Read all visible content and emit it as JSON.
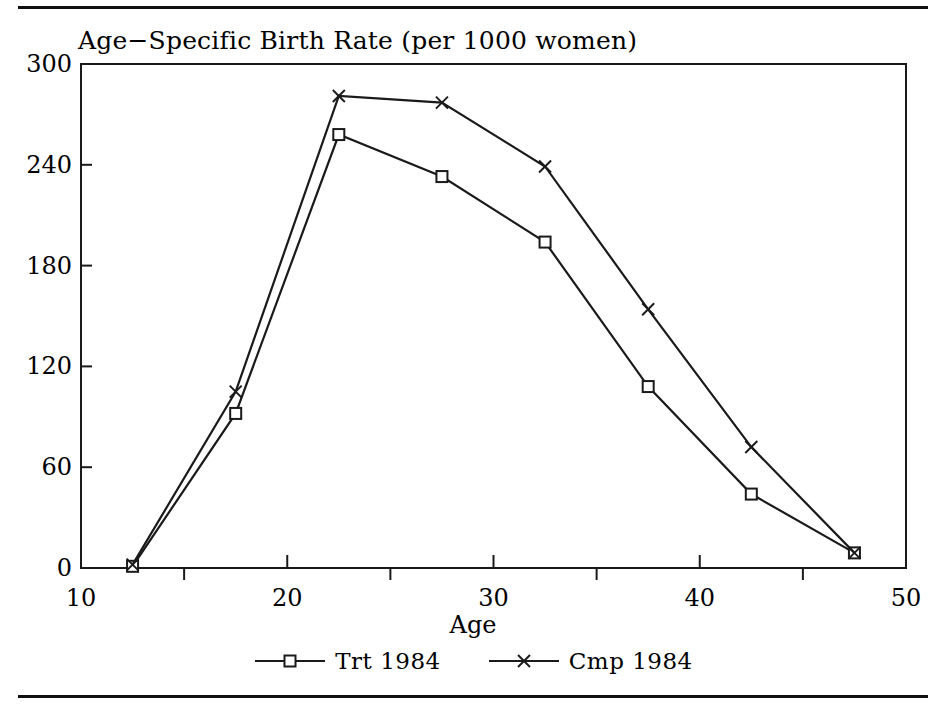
{
  "figure": {
    "title": "Age−Specific Birth Rate (per 1000 women)",
    "xaxis_title": "Age",
    "line_color": "#1a1a1a",
    "rule_color": "#111111"
  },
  "axes": {
    "x_ticks": [
      "10",
      "20",
      "30",
      "40",
      "50"
    ],
    "y_ticks": [
      "0",
      "60",
      "120",
      "180",
      "240",
      "300"
    ]
  },
  "legend": {
    "items": [
      {
        "label": "Trt 1984",
        "marker": "square-marker"
      },
      {
        "label": "Cmp 1984",
        "marker": "cross-marker"
      }
    ]
  },
  "chart_data": {
    "type": "line",
    "title": "Age−Specific Birth Rate (per 1000 women)",
    "xlabel": "Age",
    "ylabel": "",
    "xlim": [
      10,
      50
    ],
    "ylim": [
      0,
      300
    ],
    "xticks": [
      10,
      20,
      30,
      40,
      50
    ],
    "xminorticks": [
      15,
      25,
      35,
      45
    ],
    "yticks": [
      0,
      60,
      120,
      180,
      240,
      300
    ],
    "grid": false,
    "legend_position": "below-axes",
    "x": [
      12.5,
      17.5,
      22.5,
      27.5,
      32.5,
      37.5,
      42.5,
      47.5
    ],
    "series": [
      {
        "name": "Trt 1984",
        "marker": "square",
        "color": "#1a1a1a",
        "values": [
          1,
          92,
          258,
          233,
          194,
          108,
          44,
          9
        ]
      },
      {
        "name": "Cmp 1984",
        "marker": "x",
        "color": "#1a1a1a",
        "values": [
          2,
          105,
          281,
          277,
          239,
          154,
          72,
          9
        ]
      }
    ]
  }
}
